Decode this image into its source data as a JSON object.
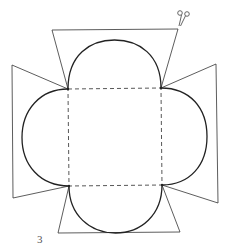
{
  "diagram": {
    "page_number": "3",
    "icons": {
      "scissors": "scissors-icon"
    },
    "colors": {
      "solid_line": "#222222",
      "dashed_line": "#444444",
      "background": "#ffffff"
    },
    "square": {
      "top_left": [
        68,
        89
      ],
      "top_right": [
        161,
        88
      ],
      "bottom_right": [
        162,
        185
      ],
      "bottom_left": [
        69,
        186
      ],
      "line_style": "dashed"
    },
    "flaps": [
      {
        "side": "top",
        "shape": "semicircle-with-trapezoid"
      },
      {
        "side": "right",
        "shape": "semicircle-with-trapezoid"
      },
      {
        "side": "bottom",
        "shape": "semicircle-with-trapezoid"
      },
      {
        "side": "left",
        "shape": "semicircle-with-trapezoid"
      }
    ]
  }
}
